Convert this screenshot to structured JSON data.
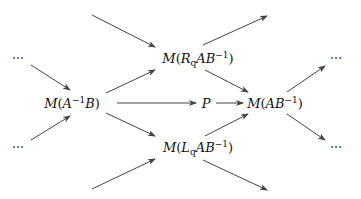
{
  "diagram": {
    "type": "commutative-diagram",
    "nodes": [
      {
        "id": "dots_tl",
        "label": "⋯",
        "x": 18,
        "y": 58
      },
      {
        "id": "dots_bl",
        "label": "⋯",
        "x": 18,
        "y": 147
      },
      {
        "id": "MAinvB",
        "label": "M(A⁻¹B)",
        "parts": {
          "pre": "M(",
          "a": "A",
          "sup": "−1",
          "b": "B",
          "post": ")"
        },
        "x": 72,
        "y": 103
      },
      {
        "id": "MRq",
        "label": "M(R_q AB⁻¹)",
        "parts": {
          "pre": "M(",
          "r": "R",
          "sub": "q",
          "ab": "AB",
          "sup": "−1",
          "post": ")"
        },
        "x": 198,
        "y": 58
      },
      {
        "id": "P",
        "label": "P",
        "x": 206,
        "y": 103
      },
      {
        "id": "MLq",
        "label": "M(L_q AB⁻¹)",
        "parts": {
          "pre": "M(",
          "l": "L",
          "sub": "q",
          "ab": "AB",
          "sup": "−1",
          "post": ")"
        },
        "x": 198,
        "y": 147
      },
      {
        "id": "MABinv",
        "label": "M(AB⁻¹)",
        "parts": {
          "pre": "M(",
          "ab": "AB",
          "sup": "−1",
          "post": ")"
        },
        "x": 275,
        "y": 103
      },
      {
        "id": "dots_tr",
        "label": "⋯",
        "x": 336,
        "y": 58
      },
      {
        "id": "dots_br",
        "label": "⋯",
        "x": 336,
        "y": 147
      }
    ],
    "edges": [
      {
        "from": "offscreen_top_left",
        "to": "MRq",
        "x1": 92,
        "y1": 15,
        "x2": 155,
        "y2": 47
      },
      {
        "from": "MRq",
        "to": "offscreen_top_right",
        "x1": 203,
        "y1": 45,
        "x2": 267,
        "y2": 16
      },
      {
        "from": "dots_tl",
        "to": "MAinvB",
        "x1": 31,
        "y1": 65,
        "x2": 70,
        "y2": 90
      },
      {
        "from": "dots_bl",
        "to": "MAinvB",
        "x1": 31,
        "y1": 140,
        "x2": 70,
        "y2": 116
      },
      {
        "from": "MAinvB",
        "to": "MRq",
        "x1": 106,
        "y1": 93,
        "x2": 155,
        "y2": 70
      },
      {
        "from": "MAinvB",
        "to": "MLq",
        "x1": 106,
        "y1": 113,
        "x2": 155,
        "y2": 136
      },
      {
        "from": "MAinvB",
        "to": "P",
        "x1": 117,
        "y1": 103,
        "x2": 196,
        "y2": 103
      },
      {
        "from": "P",
        "to": "MABinv",
        "x1": 216,
        "y1": 103,
        "x2": 243,
        "y2": 103
      },
      {
        "from": "MRq",
        "to": "MABinv",
        "x1": 205,
        "y1": 70,
        "x2": 248,
        "y2": 92
      },
      {
        "from": "MLq",
        "to": "MABinv",
        "x1": 205,
        "y1": 136,
        "x2": 248,
        "y2": 114
      },
      {
        "from": "MABinv",
        "to": "dots_tr",
        "x1": 287,
        "y1": 92,
        "x2": 325,
        "y2": 66
      },
      {
        "from": "MABinv",
        "to": "dots_br",
        "x1": 287,
        "y1": 114,
        "x2": 325,
        "y2": 140
      },
      {
        "from": "offscreen_bottom_left",
        "to": "MLq",
        "x1": 92,
        "y1": 189,
        "x2": 155,
        "y2": 159
      },
      {
        "from": "MLq",
        "to": "offscreen_bottom_right",
        "x1": 203,
        "y1": 160,
        "x2": 267,
        "y2": 190
      }
    ],
    "colors": {
      "stroke": "#444444",
      "text": "#111111",
      "background": "#ffffff"
    }
  }
}
